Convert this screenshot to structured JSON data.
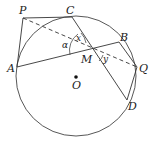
{
  "diagram": {
    "circle": {
      "center": "O",
      "cx": 76,
      "cy": 76,
      "r": 60
    },
    "points": {
      "P": {
        "label": "P",
        "x": 23,
        "y": 18
      },
      "C": {
        "label": "C",
        "x": 72,
        "y": 17
      },
      "B": {
        "label": "B",
        "x": 119,
        "y": 42
      },
      "A": {
        "label": "A",
        "x": 17,
        "y": 67
      },
      "M": {
        "label": "M",
        "x": 91,
        "y": 50
      },
      "Q": {
        "label": "Q",
        "x": 137,
        "y": 67
      },
      "D": {
        "label": "D",
        "x": 127,
        "y": 100
      },
      "O": {
        "label": "O",
        "x": 76,
        "y": 77
      }
    },
    "angles": {
      "alpha": "α",
      "x": "x",
      "y": "y"
    },
    "segments": [
      "PC",
      "PA",
      "AB",
      "CD",
      "BQ",
      "QD"
    ],
    "dashed_segments": [
      "PQ"
    ]
  }
}
